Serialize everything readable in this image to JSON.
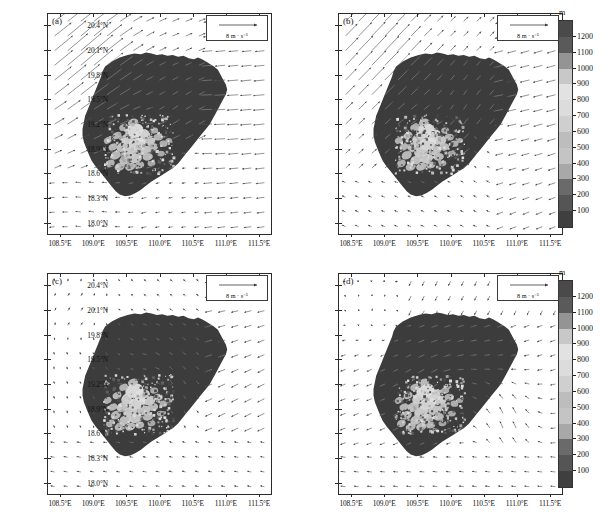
{
  "figure": {
    "width": 609,
    "height": 523,
    "background": "#ffffff",
    "panel_count": 4
  },
  "axes": {
    "xlabels": [
      "108.5°E",
      "109.0°E",
      "109.5°E",
      "110.0°E",
      "110.5°E",
      "111.0°E",
      "111.5°E"
    ],
    "xvalues": [
      108.5,
      109.0,
      109.5,
      110.0,
      110.5,
      111.0,
      111.5
    ],
    "ylabels": [
      "20.4°N",
      "20.1°N",
      "19.8°N",
      "19.5°N",
      "19.2°N",
      "18.9°N",
      "18.6°N",
      "18.3°N",
      "18.0°N"
    ],
    "yvalues": [
      20.4,
      20.1,
      19.8,
      19.5,
      19.2,
      18.9,
      18.6,
      18.3,
      18.0
    ],
    "xlim": [
      108.32,
      111.68
    ],
    "ylim": [
      17.86,
      20.54
    ]
  },
  "vector_key": {
    "label": "8 m · s⁻¹",
    "magnitude": 8,
    "units": "m s-1"
  },
  "colorbar": {
    "title": "m",
    "units": "m",
    "ticks": [
      1200,
      1100,
      1000,
      900,
      800,
      700,
      600,
      500,
      400,
      300,
      200,
      100
    ],
    "tick_labels": [
      "1200",
      "1100",
      "1000",
      "900",
      "800",
      "700",
      "600",
      "500",
      "400",
      "300",
      "200",
      "100"
    ],
    "band_colors": [
      "#4a4a4a",
      "#5a5a5a",
      "#949494",
      "#c8c8c8",
      "#e2e2e2",
      "#dcdcdc",
      "#cfcfcf",
      "#bdbdbd",
      "#c4c4c4",
      "#a8a8a8",
      "#6a6a6a",
      "#555555",
      "#3f3f3f"
    ]
  },
  "panels": [
    {
      "id": "a",
      "label": "(a)",
      "flow_description": "strong southwesterly flow over northwestern sea, easterly over eastern sea"
    },
    {
      "id": "b",
      "label": "(b)",
      "flow_description": "southerly to southwesterly flow turning easterly east of island"
    },
    {
      "id": "c",
      "label": "(c)",
      "flow_description": "weak variable northerly flow west of island, easterly offshore"
    },
    {
      "id": "d",
      "label": "(d)",
      "flow_description": "northeasterly flow with convergence southeast of island"
    }
  ],
  "chart_data": {
    "type": "heatmap",
    "title": "",
    "xlabel": "",
    "ylabel": "",
    "variable": "terrain elevation with 10 m wind vectors",
    "elevation_levels": [
      100,
      200,
      300,
      400,
      500,
      600,
      700,
      800,
      900,
      1000,
      1100,
      1200
    ],
    "elevation_units": "m",
    "region": "Hainan Island, China",
    "xlim": [
      108.32,
      111.68
    ],
    "ylim": [
      17.86,
      20.54
    ],
    "grid": false,
    "legend": "colorbar right of each row"
  }
}
